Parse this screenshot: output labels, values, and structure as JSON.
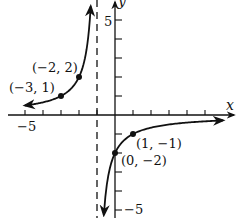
{
  "chart_data": {
    "type": "line",
    "title": "",
    "function": "f(x) = -2/(x+1)",
    "xlabel": "x",
    "ylabel": "y",
    "xlim": [
      -6,
      6.5
    ],
    "ylim": [
      -6,
      6
    ],
    "grid": false,
    "tick_labels": {
      "x": [
        {
          "value": -5,
          "label": "−5"
        }
      ],
      "y": [
        {
          "value": 5,
          "label": "5"
        },
        {
          "value": -5,
          "label": "−5"
        }
      ]
    },
    "vertical_asymptote": {
      "x": -1,
      "style": "dashed"
    },
    "horizontal_asymptote": {
      "y": 0
    },
    "points": [
      {
        "x": -3,
        "y": 1,
        "label": "(−3, 1)"
      },
      {
        "x": -2,
        "y": 2,
        "label": "(−2, 2)"
      },
      {
        "x": 0,
        "y": -2,
        "label": "(0, −2)"
      },
      {
        "x": 1,
        "y": -1,
        "label": "(1, −1)"
      }
    ],
    "series": [
      {
        "name": "left branch",
        "x_range": [
          -5,
          -1.35
        ]
      },
      {
        "name": "right branch",
        "x_range": [
          -0.62,
          6
        ]
      }
    ]
  },
  "labels": {
    "x_axis": "x",
    "y_axis": "y",
    "x_neg5": "−5",
    "y_pos5": "5",
    "y_neg5": "−5",
    "p1": "(−3, 1)",
    "p2": "(−2, 2)",
    "p3": "(0, −2)",
    "p4": "(1, −1)"
  }
}
